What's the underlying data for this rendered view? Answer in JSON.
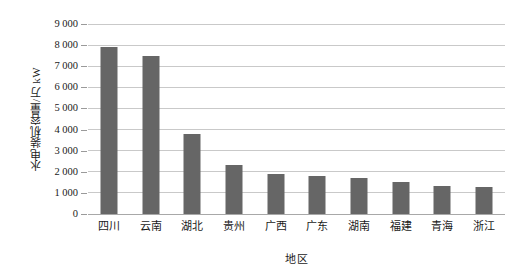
{
  "chart_data": {
    "type": "bar",
    "title": "",
    "xlabel": "地区",
    "ylabel": "水电装机容量/万 kW",
    "categories": [
      "四川",
      "云南",
      "湖北",
      "贵州",
      "广西",
      "广东",
      "湖南",
      "福建",
      "青海",
      "浙江"
    ],
    "values": [
      7900,
      7500,
      3800,
      2300,
      1900,
      1800,
      1700,
      1500,
      1350,
      1300
    ],
    "series": [
      {
        "name": "水电装机容量",
        "values": [
          7900,
          7500,
          3800,
          2300,
          1900,
          1800,
          1700,
          1500,
          1350,
          1300
        ]
      }
    ],
    "ylim": [
      0,
      9000
    ],
    "ytick_values": [
      0,
      1000,
      2000,
      3000,
      4000,
      5000,
      6000,
      7000,
      8000,
      9000
    ],
    "ytick_labels": [
      "0",
      "1 000",
      "2 000",
      "3 000",
      "4 000",
      "5 000",
      "6 000",
      "7 000",
      "8 000",
      "9 000"
    ],
    "grid": true,
    "grid_axis": "y",
    "legend": false,
    "legend_position": "none",
    "bar_color": "#666666",
    "gridline_color": "#c9c9c9",
    "background_color": "#ffffff"
  }
}
